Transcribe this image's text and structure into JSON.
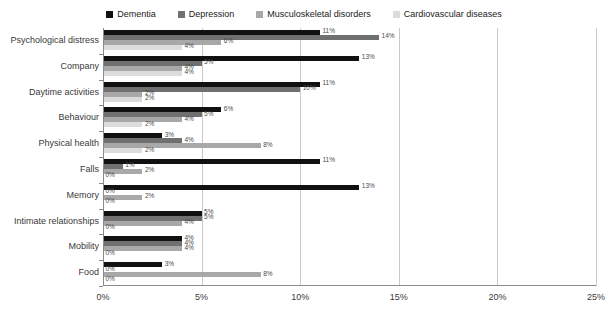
{
  "chart_data": {
    "type": "bar",
    "orientation": "horizontal",
    "title": "",
    "xlabel": "",
    "ylabel": "",
    "xlim": [
      0,
      25
    ],
    "xticks": [
      "0%",
      "5%",
      "10%",
      "15%",
      "20%",
      "25%"
    ],
    "xtick_values": [
      0,
      5,
      10,
      15,
      20,
      25
    ],
    "grid": true,
    "legend_position": "top-center",
    "categories": [
      "Psychological distress",
      "Company",
      "Daytime activities",
      "Behaviour",
      "Physical health",
      "Falls",
      "Memory",
      "Intimate relationships",
      "Mobility",
      "Food"
    ],
    "series": [
      {
        "name": "Dementia",
        "color": "#111111",
        "values": [
          11,
          13,
          11,
          6,
          3,
          11,
          13,
          5,
          4,
          3
        ],
        "labels": [
          "11%",
          "13%",
          "11%",
          "6%",
          "3%",
          "11%",
          "13%",
          "5%",
          "4%",
          "3%"
        ]
      },
      {
        "name": "Depression",
        "color": "#707070",
        "values": [
          14,
          5,
          10,
          5,
          4,
          1,
          0,
          5,
          4,
          0
        ],
        "labels": [
          "14%",
          "5%",
          "10%",
          "5%",
          "4%",
          "1%",
          "0%",
          "5%",
          "4%",
          "0%"
        ]
      },
      {
        "name": "Musculoskeletal disorders",
        "color": "#a8a8a8",
        "values": [
          6,
          4,
          2,
          4,
          8,
          2,
          2,
          4,
          4,
          8
        ],
        "labels": [
          "6%",
          "4%",
          "2%",
          "4%",
          "8%",
          "2%",
          "2%",
          "4%",
          "4%",
          "8%"
        ]
      },
      {
        "name": "Cardiovascular diseases",
        "color": "#dcdcdc",
        "values": [
          4,
          4,
          2,
          2,
          2,
          0,
          0,
          0,
          0,
          0
        ],
        "labels": [
          "4%",
          "4%",
          "2%",
          "2%",
          "2%",
          "0%",
          "0%",
          "0%",
          "0%",
          "0%"
        ]
      }
    ]
  }
}
